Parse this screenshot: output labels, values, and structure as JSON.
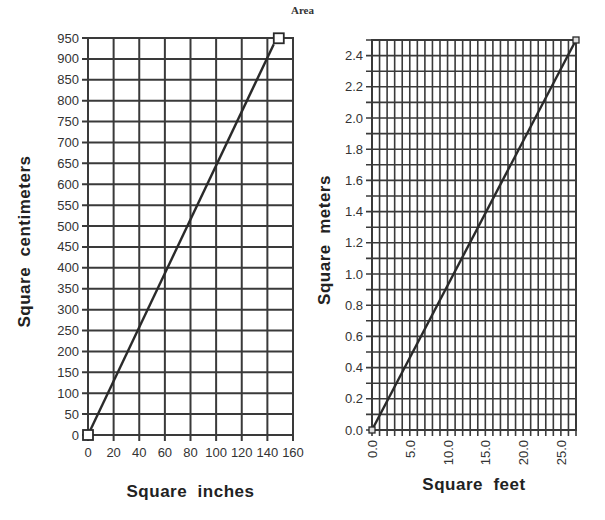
{
  "title": "Area",
  "chart_data": [
    {
      "type": "line",
      "title": "Area",
      "xlabel": "Square inches",
      "ylabel": "Square centimeters",
      "xlim": [
        0,
        160
      ],
      "ylim": [
        0,
        950
      ],
      "x_ticks": [
        "0",
        "20",
        "40",
        "60",
        "80",
        "100",
        "120",
        "140",
        "160"
      ],
      "y_ticks": [
        "0",
        "50",
        "100",
        "150",
        "200",
        "250",
        "300",
        "350",
        "400",
        "450",
        "500",
        "550",
        "600",
        "650",
        "700",
        "750",
        "800",
        "850",
        "900",
        "950"
      ],
      "grid": true,
      "series": [
        {
          "name": "sq in to sq cm",
          "x": [
            0,
            145
          ],
          "y": [
            0,
            935
          ],
          "marker": "open-square"
        }
      ]
    },
    {
      "type": "line",
      "title": "Area",
      "xlabel": "Square feet",
      "ylabel": "Square meters",
      "xlim": [
        0,
        27
      ],
      "ylim": [
        0,
        2.5
      ],
      "x_ticks": [
        "0.0",
        "5.0",
        "10.0",
        "15.0",
        "20.0",
        "25.0"
      ],
      "y_ticks": [
        "0.0",
        "0.2",
        "0.4",
        "0.6",
        "0.8",
        "1.0",
        "1.2",
        "1.4",
        "1.6",
        "1.8",
        "2.0",
        "2.2",
        "2.4"
      ],
      "grid": true,
      "series": [
        {
          "name": "sq ft to sq m",
          "x": [
            0,
            27
          ],
          "y": [
            0,
            2.5
          ],
          "marker": "small-square"
        }
      ]
    }
  ],
  "colors": {
    "grid": "#3a3a3a",
    "line": "#2a2a2a",
    "text": "#333333"
  }
}
